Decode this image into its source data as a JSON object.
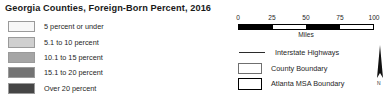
{
  "map": {
    "title": "Georgia Counties, Foreign-Born Percent, 2016",
    "choropleth_legend": {
      "classes": [
        {
          "label": "5 percent or under",
          "color": "#f7f7f7"
        },
        {
          "label": "5.1 to 10 percent",
          "color": "#cfcfcf"
        },
        {
          "label": "10.1 to 15 percent",
          "color": "#a5a5a5"
        },
        {
          "label": "15.1 to 20 percent",
          "color": "#737373"
        },
        {
          "label": "Over 20 percent",
          "color": "#454545"
        }
      ]
    },
    "scale_bar": {
      "tick_labels": [
        "0",
        "25",
        "50",
        "75",
        "100"
      ],
      "units": "Miles",
      "segments": [
        "fill",
        "blank",
        "fill",
        "blank"
      ]
    },
    "symbol_legend": {
      "items": [
        {
          "label": "Interstate Highways",
          "symbol": "line"
        },
        {
          "label": "County Boundary",
          "symbol": "box-thin"
        },
        {
          "label": "Atlanta MSA Boundary",
          "symbol": "box-thick"
        }
      ]
    },
    "north_arrow": {
      "label": "N"
    }
  }
}
